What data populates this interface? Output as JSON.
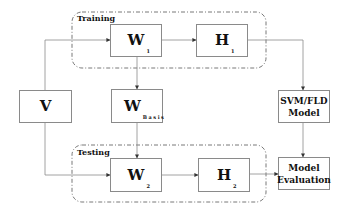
{
  "diagram": {
    "groups": {
      "training": {
        "label": "Training"
      },
      "testing": {
        "label": "Testing"
      }
    },
    "nodes": {
      "v": {
        "symbol": "V",
        "subscript": ""
      },
      "w1": {
        "symbol": "W",
        "subscript": "1"
      },
      "h1": {
        "symbol": "H",
        "subscript": "1"
      },
      "wbasis": {
        "symbol": "W",
        "subscript": "Basis"
      },
      "w2": {
        "symbol": "W",
        "subscript": "2"
      },
      "h2": {
        "symbol": "H",
        "subscript": "2"
      },
      "svm": {
        "line1": "SVM/FLD",
        "line2": "Model"
      },
      "eval": {
        "line1": "Model",
        "line2": "Evaluation"
      }
    },
    "edges": [
      [
        "V",
        "W1"
      ],
      [
        "W1",
        "H1"
      ],
      [
        "H1",
        "SVM/FLD Model"
      ],
      [
        "W1",
        "W Basis"
      ],
      [
        "W Basis",
        "W2"
      ],
      [
        "V",
        "W2"
      ],
      [
        "W2",
        "H2"
      ],
      [
        "H2",
        "Model Evaluation"
      ],
      [
        "SVM/FLD Model",
        "Model Evaluation"
      ]
    ],
    "colors": {
      "line": "#8a8a8a",
      "dash": "#555555",
      "text": "#111111"
    }
  }
}
